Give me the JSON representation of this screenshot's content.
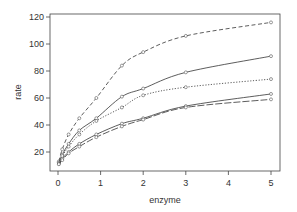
{
  "chart_data": {
    "type": "line",
    "title": "",
    "xlabel": "enzyme",
    "ylabel": "rate",
    "xlim": [
      -0.15,
      5.2
    ],
    "ylim": [
      7,
      122
    ],
    "xticks": [
      0,
      1,
      2,
      3,
      4,
      5
    ],
    "yticks": [
      20,
      40,
      60,
      80,
      100,
      120
    ],
    "grid": false,
    "legend": null,
    "x": [
      0.02,
      0.1,
      0.25,
      0.5,
      0.9,
      1.5,
      2,
      3,
      5
    ],
    "series": [
      {
        "name": "series-1",
        "style": "dashed",
        "marker": "circle",
        "values": [
          13,
          22,
          33,
          45,
          60,
          84,
          94,
          106,
          116
        ]
      },
      {
        "name": "series-2",
        "style": "solid",
        "marker": "circle",
        "values": [
          12,
          18,
          26,
          36,
          45,
          61,
          67,
          79,
          91
        ]
      },
      {
        "name": "series-3",
        "style": "dotted",
        "marker": "circle",
        "values": [
          12,
          17,
          24,
          33,
          43,
          53,
          62,
          68,
          74
        ]
      },
      {
        "name": "series-4",
        "style": "solid",
        "marker": "circle",
        "values": [
          11,
          15,
          20,
          26,
          33,
          41,
          45,
          54,
          63
        ]
      },
      {
        "name": "series-5",
        "style": "longdash",
        "marker": "circle",
        "values": [
          11,
          14,
          19,
          24,
          31,
          39,
          44,
          53,
          59
        ]
      }
    ]
  }
}
